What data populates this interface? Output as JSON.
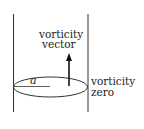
{
  "diagram": {
    "labels": {
      "top_line1": "vorticity",
      "top_line2": "vector",
      "right_line1": "vorticity",
      "right_line2": "zero",
      "radius": "a"
    },
    "colors": {
      "stroke": "#333333",
      "background": "#ffffff"
    }
  }
}
